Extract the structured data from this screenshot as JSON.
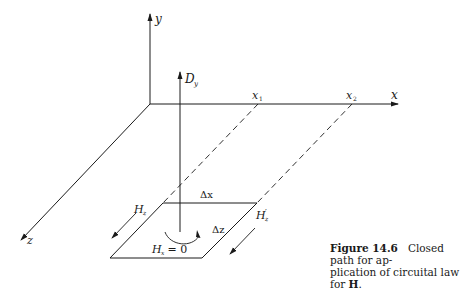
{
  "figure": {
    "axes": {
      "y_label": "y",
      "x_label": "x",
      "z_label": "z",
      "x1_label": "x",
      "x1_sub": "1",
      "x2_label": "x",
      "x2_sub": "2"
    },
    "field": {
      "dy_label": "D",
      "dy_sub": "y"
    },
    "loop": {
      "dx_label": "Δx",
      "dz_label": "Δz",
      "hz_label": "H",
      "hz_sub": "z",
      "hz_prime_label": "H",
      "hz_prime_sub": "z",
      "hz_prime_mark": "′",
      "hx_label": "H",
      "hx_sub": "x",
      "hx_eq": " = 0"
    },
    "caption": {
      "number": "Figure 14.6",
      "text_part1": "Closed path for ap-",
      "text_part2": "plication of circuital law for ",
      "bold_symbol": "H",
      "end": "."
    }
  }
}
